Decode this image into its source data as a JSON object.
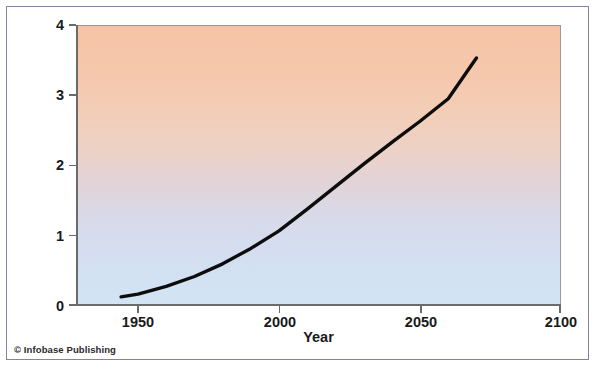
{
  "figure": {
    "credit": "© Infobase Publishing",
    "frame_color": "#8b7fa6",
    "background": "#ffffff"
  },
  "chart_data": {
    "type": "line",
    "title": "",
    "xlabel": "Year",
    "ylabel": "Temperature change (°C)",
    "xlim": [
      1928,
      2100
    ],
    "ylim": [
      0,
      4
    ],
    "xticks": [
      1950,
      2000,
      2050,
      2100
    ],
    "xtick_labels": [
      "1950",
      "2000",
      "2050",
      "2100"
    ],
    "yticks": [
      0,
      1,
      2,
      3,
      4
    ],
    "ytick_labels": [
      "0",
      "1",
      "2",
      "3",
      "4"
    ],
    "grid": false,
    "legend": null,
    "plot_background": {
      "type": "vertical_gradient",
      "top_color": "#f6c3a6",
      "mid_color": "#dcd6e4",
      "bottom_color": "#d2e5f4"
    },
    "series": [
      {
        "name": "Projected global temperature change",
        "color": "#0d0d0d",
        "line_width": 3.4,
        "x": [
          1944,
          1950,
          1960,
          1970,
          1980,
          1990,
          2000,
          2010,
          2020,
          2030,
          2040,
          2050,
          2060,
          2070
        ],
        "y": [
          0.13,
          0.17,
          0.28,
          0.42,
          0.6,
          0.82,
          1.07,
          1.38,
          1.7,
          2.02,
          2.33,
          2.63,
          2.95,
          3.53
        ]
      }
    ]
  }
}
